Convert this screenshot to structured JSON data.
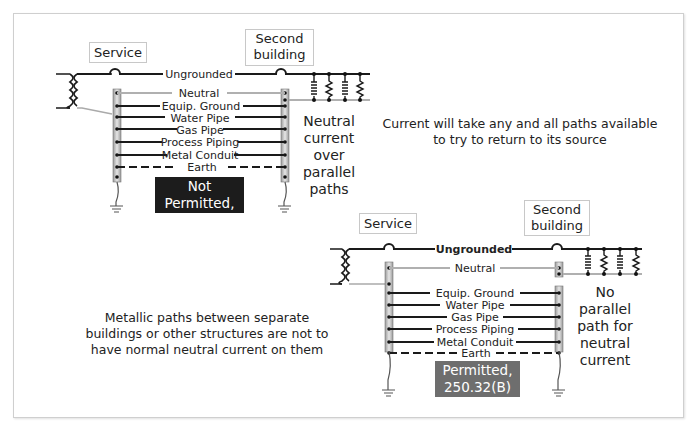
{
  "figure": {
    "notes": {
      "top_right": "Current will take any and all paths available to try to return to its source",
      "bottom_left": "Metallic paths between separate buildings or other structures are not to have normal neutral current on them"
    },
    "top_diagram": {
      "service_label": "Service",
      "second_building_label_line1": "Second",
      "second_building_label_line2": "building",
      "conductors": {
        "ungrounded": "Ungrounded",
        "neutral": "Neutral",
        "equip_ground": "Equip. Ground",
        "water_pipe": "Water Pipe",
        "gas_pipe": "Gas Pipe",
        "process_piping": "Process Piping",
        "metal_conduit": "Metal Conduit",
        "earth": "Earth"
      },
      "side_note_lines": [
        "Neutral",
        "current",
        "over",
        "parallel",
        "paths"
      ],
      "verdict_line1": "Not Permitted,",
      "verdict_line2": "250.32(B)(1)",
      "verdict_color": "#1c1c1c"
    },
    "bottom_diagram": {
      "service_label": "Service",
      "second_building_label_line1": "Second",
      "second_building_label_line2": "building",
      "conductors": {
        "ungrounded": "Ungrounded",
        "neutral": "Neutral",
        "equip_ground": "Equip. Ground",
        "water_pipe": "Water Pipe",
        "gas_pipe": "Gas Pipe",
        "process_piping": "Process Piping",
        "metal_conduit": "Metal Conduit",
        "earth": "Earth"
      },
      "side_note_lines": [
        "No",
        "parallel",
        "path for",
        "neutral",
        "current"
      ],
      "verdict_line1": "Permitted,",
      "verdict_line2": "250.32(B)(1)",
      "verdict_color": "#6e6e6e"
    },
    "colors": {
      "conductor": "#1a1a1a",
      "neutral_wire": "#b0b0b0",
      "bus_bar": "#c8c8c8",
      "frame_border": "#cfcfcf"
    }
  }
}
